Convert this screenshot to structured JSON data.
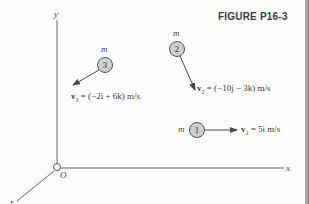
{
  "figure": {
    "caption": "FIGURE P16-3",
    "axes": {
      "x_label": "x",
      "y_label": "y",
      "z_label": "z",
      "origin_label": "O"
    },
    "particles": [
      {
        "id": "1",
        "mass_label": "m",
        "number": "1",
        "velocity_label": "v₁ = 5i m/s",
        "velocity_name": "v",
        "velocity_sub": "1",
        "velocity_expr": " = 5i m/s"
      },
      {
        "id": "2",
        "mass_label": "m",
        "number": "2",
        "velocity_label": "v₂ = (−10j − 3k) m/s",
        "velocity_name": "v",
        "velocity_sub": "2",
        "velocity_expr": " = (−10j − 3k) m/s"
      },
      {
        "id": "3",
        "mass_label": "m",
        "number": "3",
        "velocity_label": "v₃ = (−2i + 6k) m/s",
        "velocity_name": "v",
        "velocity_sub": "3",
        "velocity_expr": " = (−2i + 6k) m/s"
      }
    ],
    "colors": {
      "line": "#555555",
      "particle_fill": "#cfcfcf",
      "particle_stroke": "#555555",
      "text": "#3a3a3a"
    }
  }
}
